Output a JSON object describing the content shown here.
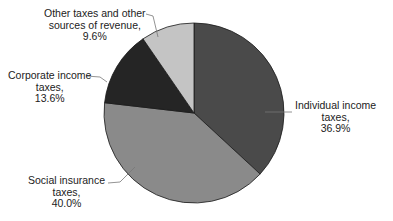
{
  "chart_data": {
    "type": "pie",
    "title": "",
    "start_angle_deg": 0,
    "direction": "clockwise",
    "categories": [
      "Individual income taxes",
      "Social insurance taxes",
      "Corporate income taxes",
      "Other taxes and other sources of revenue"
    ],
    "values": [
      36.9,
      40.0,
      13.6,
      9.6
    ],
    "unit": "%",
    "colors": [
      "#4a4a4a",
      "#8a8a8a",
      "#252525",
      "#c4c4c4"
    ],
    "labels": [
      {
        "lines": [
          "Individual income",
          "taxes,",
          "36.9%"
        ]
      },
      {
        "lines": [
          "Social insurance",
          "taxes,",
          "40.0%"
        ]
      },
      {
        "lines": [
          "Corporate income",
          "taxes,",
          "13.6%"
        ]
      },
      {
        "lines": [
          "Other taxes and other",
          "sources of revenue,",
          "9.6%"
        ]
      }
    ]
  }
}
